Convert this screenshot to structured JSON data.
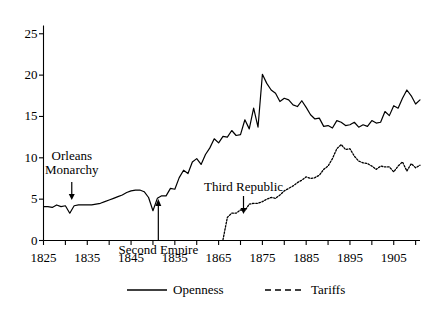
{
  "chart_data": {
    "type": "line",
    "title": "",
    "xlabel": "",
    "ylabel": "",
    "xlim": [
      1825,
      1911
    ],
    "ylim": [
      0,
      26
    ],
    "grid": false,
    "legend_position": "bottom",
    "y_ticks": [
      "0",
      "5",
      "10",
      "15",
      "20",
      "25"
    ],
    "y_tick_values": [
      0,
      5,
      10,
      15,
      20,
      25
    ],
    "x_ticks": [
      "1825",
      "1835",
      "1845",
      "1855",
      "1865",
      "1875",
      "1885",
      "1895",
      "1905"
    ],
    "x_tick_values": [
      1825,
      1835,
      1845,
      1855,
      1865,
      1875,
      1885,
      1895,
      1905
    ],
    "x_minor_tick_values": [
      1830,
      1840,
      1850,
      1860,
      1870,
      1880,
      1890,
      1900,
      1910
    ],
    "series": [
      {
        "name": "Openness",
        "style": "solid",
        "color": "#000000",
        "x": [
          1825,
          1826,
          1827,
          1828,
          1829,
          1830,
          1831,
          1832,
          1833,
          1834,
          1835,
          1836,
          1837,
          1838,
          1839,
          1840,
          1841,
          1842,
          1843,
          1844,
          1845,
          1846,
          1847,
          1848,
          1849,
          1850,
          1851,
          1852,
          1853,
          1854,
          1855,
          1856,
          1857,
          1858,
          1859,
          1860,
          1861,
          1862,
          1863,
          1864,
          1865,
          1866,
          1867,
          1868,
          1869,
          1870,
          1871,
          1872,
          1873,
          1874,
          1875,
          1876,
          1877,
          1878,
          1879,
          1880,
          1881,
          1882,
          1883,
          1884,
          1885,
          1886,
          1887,
          1888,
          1889,
          1890,
          1891,
          1892,
          1893,
          1894,
          1895,
          1896,
          1897,
          1898,
          1899,
          1900,
          1901,
          1902,
          1903,
          1904,
          1905,
          1906,
          1907,
          1908,
          1909,
          1910,
          1911
        ],
        "y": [
          4.1,
          4.1,
          4.0,
          4.3,
          4.1,
          4.2,
          3.3,
          4.2,
          4.3,
          4.3,
          4.3,
          4.3,
          4.4,
          4.5,
          4.7,
          4.9,
          5.1,
          5.3,
          5.5,
          5.8,
          6.0,
          6.1,
          6.1,
          5.9,
          5.2,
          3.6,
          5.1,
          5.4,
          5.4,
          6.3,
          6.2,
          7.6,
          8.5,
          8.1,
          9.5,
          9.9,
          9.2,
          10.4,
          11.2,
          12.3,
          11.8,
          12.6,
          12.5,
          13.3,
          12.7,
          12.8,
          14.6,
          13.5,
          16.0,
          13.7,
          20.1,
          19.0,
          18.2,
          17.8,
          16.8,
          17.2,
          17.0,
          16.4,
          16.2,
          16.9,
          16.1,
          15.2,
          14.7,
          14.8,
          13.8,
          13.9,
          13.6,
          14.5,
          14.3,
          13.9,
          14.0,
          14.3,
          13.7,
          14.0,
          13.8,
          14.5,
          14.2,
          14.3,
          15.6,
          15.1,
          16.3,
          16.0,
          17.2,
          18.2,
          17.5,
          16.5,
          17.0
        ]
      },
      {
        "name": "Tariffs",
        "style": "dashed",
        "color": "#000000",
        "x": [
          1866,
          1867,
          1868,
          1869,
          1870,
          1871,
          1872,
          1873,
          1874,
          1875,
          1876,
          1877,
          1878,
          1879,
          1880,
          1881,
          1882,
          1883,
          1884,
          1885,
          1886,
          1887,
          1888,
          1889,
          1890,
          1891,
          1892,
          1893,
          1894,
          1895,
          1896,
          1897,
          1898,
          1899,
          1900,
          1901,
          1902,
          1903,
          1904,
          1905,
          1906,
          1907,
          1908,
          1909,
          1910,
          1911
        ],
        "y": [
          0.1,
          2.8,
          3.3,
          3.3,
          3.7,
          3.6,
          4.4,
          4.5,
          4.5,
          4.7,
          5.0,
          5.2,
          5.1,
          5.5,
          6.0,
          6.3,
          6.6,
          7.0,
          7.3,
          7.7,
          7.5,
          7.6,
          7.9,
          8.6,
          9.0,
          9.9,
          11.1,
          11.6,
          11.0,
          11.1,
          10.2,
          9.6,
          9.4,
          9.3,
          9.0,
          8.6,
          9.0,
          8.9,
          8.9,
          8.3,
          9.0,
          9.5,
          8.4,
          9.3,
          8.8,
          9.1
        ]
      }
    ],
    "annotations": [
      {
        "id": "orleans-monarchy",
        "text_line1": "Orleans",
        "text_line2": "Monarchy",
        "arrow_points_to_year": 1831,
        "arrow_points_to_value": 3.5
      },
      {
        "id": "second-empire",
        "text_line1": "Second Empire",
        "text_line2": "",
        "arrow_points_to_year": 1851,
        "arrow_points_to_value": 5.2
      },
      {
        "id": "third-republic",
        "text_line1": "Third Republic",
        "text_line2": "",
        "arrow_points_to_year": 1870,
        "arrow_points_to_value": 3.9
      }
    ],
    "legend": [
      {
        "label": "Openness",
        "style": "solid"
      },
      {
        "label": "Tariffs",
        "style": "dashed"
      }
    ]
  }
}
